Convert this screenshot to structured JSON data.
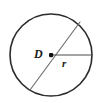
{
  "figure": {
    "kind": "geometry-diagram",
    "shape": "circle",
    "background_color": "#ffffff",
    "labels": {
      "diameter": "D",
      "radius": "r"
    },
    "colors": {
      "circle_stroke": "#2b2b2b",
      "diameter_stroke": "#6e6e6e",
      "radius_stroke": "#4a4a4a",
      "center_dot": "#111111",
      "label_text": "#1a1a1a"
    },
    "geometry": {
      "center_x": 51,
      "center_y": 55,
      "radius_px": 41,
      "circle_stroke_width": 1.6,
      "diameter_endpoints": [
        [
          30,
          90
        ],
        [
          80,
          22
        ]
      ],
      "radius_endpoint": [
        92,
        55
      ],
      "center_dot_size": 4
    },
    "icon_names": {
      "circle": "circle-outline-icon",
      "diameter": "diameter-line-icon",
      "radius": "radius-line-icon",
      "center": "center-point-icon"
    }
  }
}
